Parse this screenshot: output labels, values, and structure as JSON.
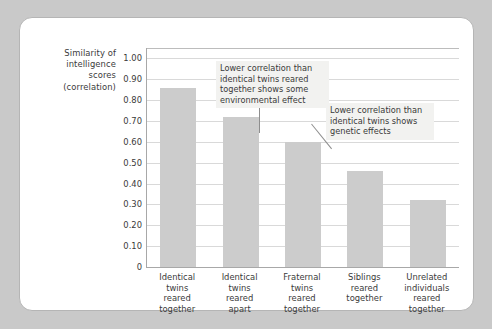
{
  "chart_data": {
    "type": "bar",
    "title": "",
    "subtitle": "",
    "xlabel": "",
    "ylabel": "Similarity of intelligence scores (correlation)",
    "ylabel_lines": [
      "Similarity of",
      "intelligence",
      "scores",
      "(correlation)"
    ],
    "categories": [
      "Identical twins reared together",
      "Identical twins reared apart",
      "Fraternal twins reared together",
      "Siblings reared together",
      "Unrelated individuals reared together"
    ],
    "category_lines": [
      [
        "Identical",
        "twins",
        "reared",
        "together"
      ],
      [
        "Identical",
        "twins",
        "reared",
        "apart"
      ],
      [
        "Fraternal",
        "twins",
        "reared",
        "together"
      ],
      [
        "Siblings",
        "reared",
        "together"
      ],
      [
        "Unrelated",
        "individuals",
        "reared",
        "together"
      ]
    ],
    "values": [
      0.86,
      0.72,
      0.6,
      0.46,
      0.32
    ],
    "ylim": [
      0,
      1.05
    ],
    "ytick_values": [
      1.0,
      0.9,
      0.8,
      0.7,
      0.6,
      0.5,
      0.4,
      0.3,
      0.2,
      0.1,
      0
    ],
    "ytick_labels": [
      "1.00",
      "0.90",
      "0.80",
      "0.70",
      "0.60",
      "0.50",
      "0.40",
      "0.30",
      "0.20",
      "0.10",
      "0"
    ],
    "grid": true,
    "legend": null,
    "bar_color": "#cccccc",
    "gridline_color": "#d9d9d9",
    "axis_color": "#a8a8a8",
    "text_color": "#3a3a3a",
    "annotations": [
      {
        "id": "environmental",
        "text": "Lower correlation than identical twins reared together shows some environmental effect",
        "lines": [
          "Lower correlation than",
          "identical twins reared",
          "together shows some",
          "environmental effect"
        ],
        "points_to_category": "Identical twins reared apart",
        "background": "#f2f2f0"
      },
      {
        "id": "genetic",
        "text": "Lower correlation than identical twins shows genetic effects",
        "lines": [
          "Lower correlation than",
          "identical twins shows",
          "genetic effects"
        ],
        "points_to_category": "Fraternal twins reared together",
        "background": "#f2f2f0"
      }
    ]
  }
}
